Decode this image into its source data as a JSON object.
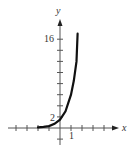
{
  "chart_data": {
    "type": "line",
    "title": "",
    "xlabel": "x",
    "ylabel": "y",
    "tick_labels": {
      "x": [
        "1"
      ],
      "y": [
        "2",
        "16"
      ]
    },
    "x_tick_step": 1,
    "y_tick_step": 2,
    "xlim": [
      -5,
      5
    ],
    "ylim": [
      -2,
      18
    ],
    "grid": false,
    "legend": null,
    "series": [
      {
        "name": "curve",
        "color": "#111111",
        "x": [
          -2,
          -1.5,
          -1,
          -0.5,
          0,
          0.5,
          1,
          1.25,
          1.5,
          1.6
        ],
        "y": [
          0.1,
          0.2,
          0.35,
          0.75,
          1.5,
          3,
          6,
          8.5,
          12,
          17
        ]
      }
    ]
  },
  "labels": {
    "x_axis": "x",
    "y_axis": "y",
    "x_tick_1": "1",
    "y_tick_2": "2",
    "y_tick_16": "16"
  }
}
